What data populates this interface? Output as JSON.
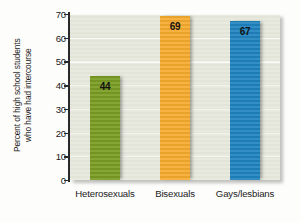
{
  "chart_data": {
    "type": "bar",
    "title": "",
    "xlabel": "",
    "ylabel_line1": "Percent of high school students",
    "ylabel_line2": "who have had intercourse",
    "categories": [
      "Heterosexuals",
      "Bisexuals",
      "Gays/lesbians"
    ],
    "values": [
      44,
      69,
      67
    ],
    "value_labels": [
      "44",
      "69",
      "67"
    ],
    "bar_colors": [
      "#7a9c23",
      "#f7ab2e",
      "#1f83bf"
    ],
    "ylim": [
      0,
      70
    ],
    "yticks": [
      70,
      60,
      50,
      40,
      30,
      20,
      10,
      0
    ],
    "ytick_labels": [
      "70",
      "60",
      "50",
      "40",
      "30",
      "20",
      "10",
      "0"
    ],
    "grid": true,
    "legend": "none",
    "plot_background": "#e7e9dd",
    "axis_color": "#2a2a2a",
    "gridline_color": "#fbfbf6"
  }
}
